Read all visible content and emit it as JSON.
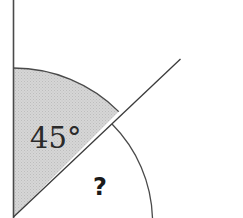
{
  "diagram": {
    "type": "angle-diagram",
    "known_angle_label": "45°",
    "unknown_angle_label": "?",
    "colors": {
      "line": "#4a4a4a",
      "shaded_fill": "#cfcfcf",
      "background": "#ffffff"
    }
  }
}
